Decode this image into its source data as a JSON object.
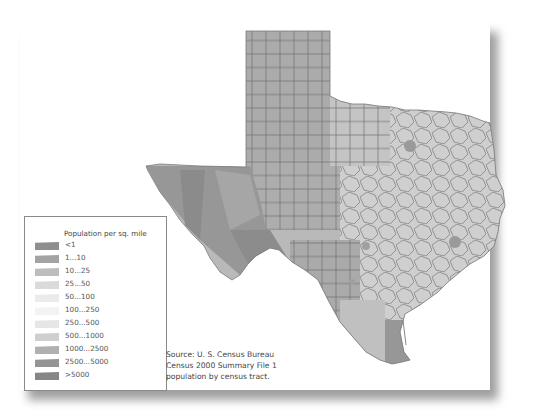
{
  "map": {
    "subject": "Texas counties",
    "legend": {
      "title": "Population per sq. mile",
      "items": [
        {
          "label": "<1",
          "color": "#8e8e8e"
        },
        {
          "label": "1...10",
          "color": "#a3a3a3"
        },
        {
          "label": "10...25",
          "color": "#bdbdbd"
        },
        {
          "label": "25...50",
          "color": "#dadada"
        },
        {
          "label": "50...100",
          "color": "#ebebeb"
        },
        {
          "label": "100...250",
          "color": "#f3f3f3"
        },
        {
          "label": "250...500",
          "color": "#e6e6e6"
        },
        {
          "label": "500...1000",
          "color": "#cfcfcf"
        },
        {
          "label": "1000...2500",
          "color": "#b0b0b0"
        },
        {
          "label": "2500...5000",
          "color": "#949494"
        },
        {
          "label": ">5000",
          "color": "#868686"
        }
      ]
    },
    "source": {
      "line1": "Source: U. S. Census Bureau",
      "line2": "Census 2000 Summary File 1",
      "line3": "population by census tract."
    }
  }
}
